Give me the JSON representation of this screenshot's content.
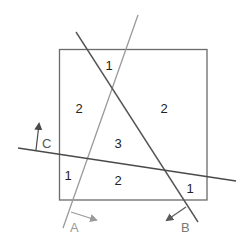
{
  "colors": {
    "square": "#6b6b6b",
    "line_a": "#9a9a9a",
    "line_b": "#555555",
    "line_c": "#4a4a4a",
    "label_text": "#222222",
    "arrow_a": "#9a9a9a",
    "arrow_b": "#5a5a5a",
    "arrow_c": "#4a4a4a",
    "line_labels": "#888888"
  },
  "lines": {
    "a": {
      "label": "A"
    },
    "b": {
      "label": "B"
    },
    "c": {
      "label": "C"
    }
  },
  "regions": [
    {
      "value": "1"
    },
    {
      "value": "2"
    },
    {
      "value": "2"
    },
    {
      "value": "3"
    },
    {
      "value": "1"
    },
    {
      "value": "2"
    },
    {
      "value": "1"
    }
  ]
}
